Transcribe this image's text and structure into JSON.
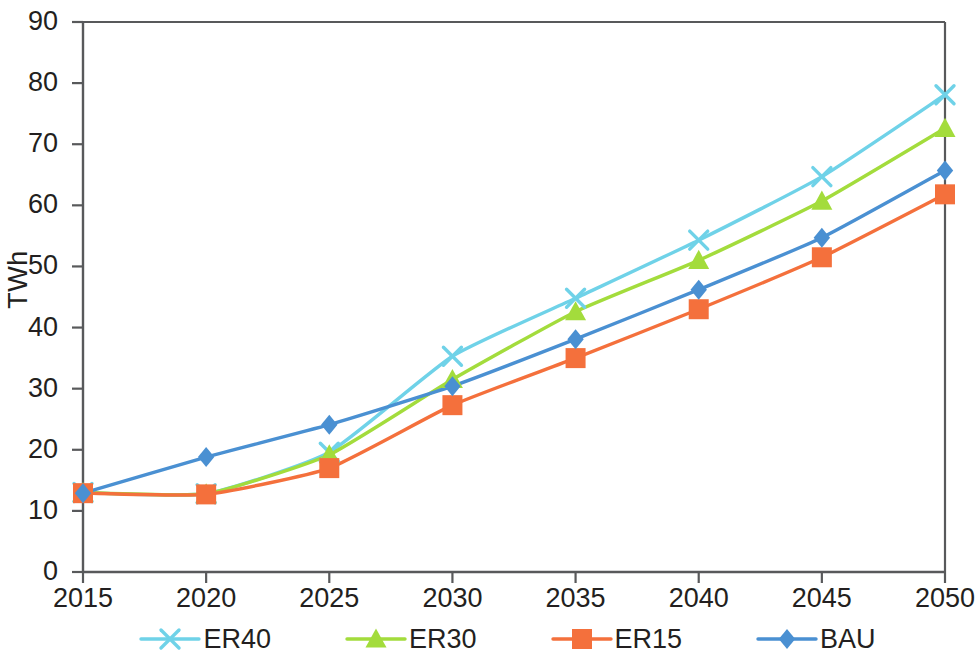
{
  "chart_data": {
    "type": "line",
    "title": "",
    "subtitle": "",
    "xlabel": "",
    "ylabel": "TWh",
    "categories": [
      2015,
      2020,
      2025,
      2030,
      2035,
      2040,
      2045,
      2050
    ],
    "xtick_labels": [
      "2015",
      "2020",
      "2025",
      "2030",
      "2035",
      "2040",
      "2045",
      "2050"
    ],
    "ytick_labels": [
      "0",
      "10",
      "20",
      "30",
      "40",
      "50",
      "60",
      "70",
      "80",
      "90"
    ],
    "ytick_values": [
      0,
      10,
      20,
      30,
      40,
      50,
      60,
      70,
      80,
      90
    ],
    "xlim": [
      2015,
      2050
    ],
    "ylim": [
      0,
      90
    ],
    "grid": false,
    "legend_position": "bottom",
    "series": [
      {
        "name": "ER40",
        "color": "#6FD2E8",
        "marker": "x-marker",
        "values": [
          13.0,
          12.8,
          19.6,
          35.3,
          44.8,
          54.3,
          64.7,
          78.1
        ]
      },
      {
        "name": "ER30",
        "color": "#A3DC3C",
        "marker": "triangle-marker",
        "values": [
          13.0,
          12.8,
          19.2,
          31.5,
          42.6,
          51.0,
          60.7,
          72.6
        ]
      },
      {
        "name": "ER15",
        "color": "#F4703C",
        "marker": "square-marker",
        "values": [
          12.9,
          12.7,
          17.0,
          27.3,
          35.0,
          43.0,
          51.5,
          61.8
        ]
      },
      {
        "name": "BAU",
        "color": "#4A90D2",
        "marker": "diamond-marker",
        "values": [
          12.9,
          18.8,
          24.1,
          30.4,
          38.1,
          46.2,
          54.7,
          65.7
        ]
      }
    ]
  },
  "legend": {
    "items": [
      {
        "label": "ER40"
      },
      {
        "label": "ER30"
      },
      {
        "label": "ER15"
      },
      {
        "label": "BAU"
      }
    ]
  },
  "axes": {
    "y_title": "TWh"
  }
}
